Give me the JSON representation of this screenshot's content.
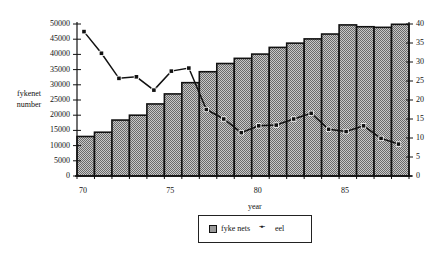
{
  "chart_data": {
    "type": "bar+line",
    "title": "",
    "xlabel": "year",
    "ylabel": "fykenet number",
    "y2label": "",
    "categories": [
      70,
      71,
      72,
      73,
      74,
      75,
      76,
      77,
      78,
      79,
      80,
      81,
      82,
      83,
      84,
      85,
      86,
      87,
      88
    ],
    "x_tick_labels": [
      "70",
      "75",
      "80",
      "85"
    ],
    "ylim": [
      0,
      50000
    ],
    "y_ticks": [
      0,
      5000,
      10000,
      15000,
      20000,
      25000,
      30000,
      35000,
      40000,
      45000,
      50000
    ],
    "y2lim": [
      0,
      40
    ],
    "y2_ticks": [
      0,
      5,
      10,
      15,
      20,
      25,
      30,
      35,
      40
    ],
    "grid": false,
    "legend_position": "bottom-center",
    "series": [
      {
        "name": "fyke nets",
        "type": "bar",
        "axis": "left",
        "values": [
          13000,
          14400,
          18400,
          20000,
          23700,
          27000,
          30700,
          34300,
          37000,
          38700,
          40100,
          42300,
          43700,
          45100,
          46700,
          49700,
          49100,
          48900,
          49900
        ]
      },
      {
        "name": "eel",
        "type": "line",
        "axis": "right",
        "values": [
          38,
          32.3,
          25.7,
          26.1,
          22.6,
          27.6,
          28.4,
          17.5,
          15,
          11.4,
          13.2,
          13.4,
          15,
          16.5,
          12.3,
          11.7,
          13.2,
          9.9,
          8.4
        ]
      }
    ]
  },
  "labels": {
    "ylabel_line1": "fykenet",
    "ylabel_line2": "number",
    "xlabel": "year",
    "legend_bar": "fyke nets",
    "legend_line": "eel",
    "legend_line_marker": "-▪-"
  },
  "colors": {
    "bar_fill": "#9c9c9c",
    "bar_stroke": "#111111",
    "line": "#111111"
  }
}
